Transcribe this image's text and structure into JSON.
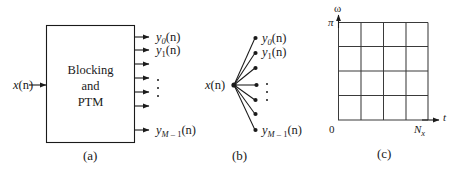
{
  "figure": {
    "background": "#ffffff",
    "ink": "#1a1a1a",
    "panels": [
      {
        "id": "a",
        "caption": "(a)",
        "type": "block-diagram",
        "input_label": "x(n)",
        "block_text_lines": [
          "Blocking",
          "and",
          "PTM"
        ],
        "output_count": 7,
        "output_labels": [
          "y_0(n)",
          "y_1(n)",
          "",
          "",
          "",
          "",
          "y_{M-1}(n)"
        ],
        "ellipsis": "vertical-dots"
      },
      {
        "id": "b",
        "caption": "(b)",
        "type": "fan-out",
        "input_label": "x(n)",
        "branch_count": 7,
        "output_labels": [
          "y_0(n)",
          "y_1(n)",
          "",
          "",
          "",
          "",
          "y_{M-1}(n)"
        ],
        "ellipsis": "vertical-dots"
      },
      {
        "id": "c",
        "caption": "(c)",
        "type": "time-frequency-grid",
        "y_axis_label": "ω",
        "x_axis_label": "t",
        "y_max_tick": "π",
        "origin_tick": "0",
        "x_max_tick": "N_x",
        "grid_rows": 4,
        "grid_cols": 4
      }
    ],
    "labels": {
      "x_of_n": {
        "base": "x",
        "arg": "(n)"
      },
      "y0": {
        "base": "y",
        "sub": "0",
        "arg": "(n)"
      },
      "y1": {
        "base": "y",
        "sub": "1",
        "arg": "(n)"
      },
      "yM1": {
        "base": "y",
        "sub": "M",
        "dash": " – ",
        "sub2": "1",
        "arg": "(n)"
      },
      "omega": "ω",
      "pi": "π",
      "t": "t",
      "zero": "0",
      "Nx": {
        "base": "N",
        "sub": "x"
      }
    },
    "captions": {
      "a": "(a)",
      "b": "(b)",
      "c": "(c)"
    },
    "block_text": {
      "line1": "Blocking",
      "line2": "and",
      "line3": "PTM"
    }
  }
}
